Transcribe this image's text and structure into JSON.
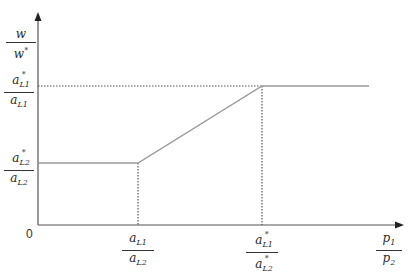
{
  "diagram": {
    "type": "economics-line-diagram",
    "colors": {
      "axis": "#333333",
      "line": "#9a9a9a",
      "dotted": "#555555",
      "background": "#ffffff"
    },
    "y_axis_label": {
      "num": "w",
      "den": "w*"
    },
    "x_axis_label": {
      "num": "p1",
      "den": "p2"
    },
    "origin_label": "0",
    "y_ticks": [
      {
        "id": "high",
        "num": "a*L1",
        "den": "aL1"
      },
      {
        "id": "low",
        "num": "a*L2",
        "den": "aL2"
      }
    ],
    "x_ticks": [
      {
        "id": "left",
        "num": "aL1",
        "den": "aL2"
      },
      {
        "id": "right",
        "num": "a*L1",
        "den": "a*L2"
      }
    ],
    "curve": {
      "segments": [
        {
          "from": "y=a*L2/aL2 at x=0",
          "to": "x=aL1/aL2",
          "shape": "horizontal"
        },
        {
          "from": "x=aL1/aL2",
          "to": "x=a*L1/a*L2",
          "shape": "rising-linear"
        },
        {
          "from": "x=a*L1/a*L2",
          "to": "end",
          "shape": "horizontal",
          "level": "a*L1/aL1"
        }
      ]
    },
    "guides": [
      "dotted vertical from x=aL1/aL2 to axis",
      "dotted vertical from x=a*L1/a*L2 to axis",
      "dotted horizontal at y=a*L1/aL1 from axis to x=a*L1/a*L2"
    ]
  }
}
